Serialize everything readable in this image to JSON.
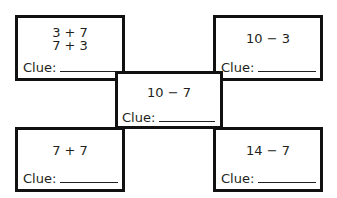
{
  "boxes": [
    {
      "id": "top-left",
      "lines": [
        "3 + 7",
        "7 + 3"
      ],
      "clue_label": "Clue:"
    },
    {
      "id": "top-right",
      "lines": [
        "10 − 3"
      ],
      "clue_label": "Clue:"
    },
    {
      "id": "bottom-left",
      "lines": [
        "7 + 7"
      ],
      "clue_label": "Clue:"
    },
    {
      "id": "bottom-right",
      "lines": [
        "14 − 7"
      ],
      "clue_label": "Clue:"
    },
    {
      "id": "center",
      "lines": [
        "10 − 7"
      ],
      "clue_label": "Clue:"
    }
  ]
}
